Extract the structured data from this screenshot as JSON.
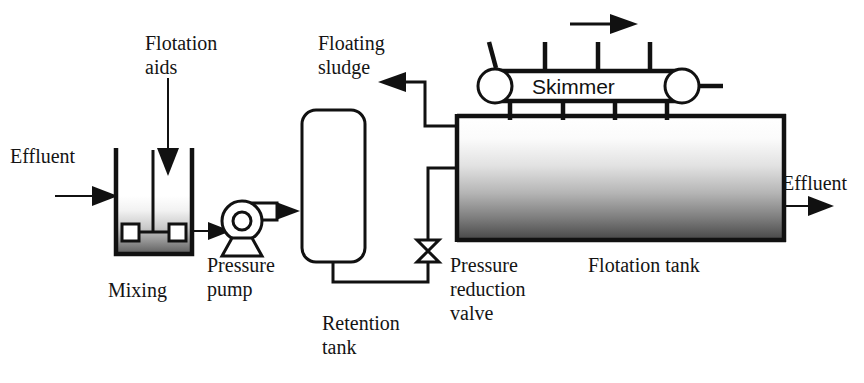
{
  "diagram": {
    "type": "process-flow",
    "labels": {
      "effluent_in": "Effluent",
      "flotation_aids": "Flotation\naids",
      "flotation_aids_line1": "Flotation",
      "flotation_aids_line2": "aids",
      "floating_sludge_line1": "Floating",
      "floating_sludge_line2": "sludge",
      "mixing": "Mixing",
      "pressure_pump_line1": "Pressure",
      "pressure_pump_line2": "pump",
      "retention_tank_line1": "Retention",
      "retention_tank_line2": "tank",
      "pressure_reduction_valve_line1": "Pressure",
      "pressure_reduction_valve_line2": "reduction",
      "pressure_reduction_valve_line3": "valve",
      "skimmer": "Skimmer",
      "flotation_tank": "Flotation tank",
      "effluent_out": "Effluent"
    },
    "components": [
      {
        "name": "mixing-tank",
        "label": "Mixing"
      },
      {
        "name": "pressure-pump",
        "label": "Pressure pump"
      },
      {
        "name": "retention-tank",
        "label": "Retention tank"
      },
      {
        "name": "pressure-reduction-valve",
        "label": "Pressure reduction valve"
      },
      {
        "name": "flotation-tank",
        "label": "Flotation tank"
      },
      {
        "name": "skimmer",
        "label": "Skimmer"
      }
    ],
    "streams": [
      {
        "name": "effluent-inlet",
        "label": "Effluent",
        "direction": "right"
      },
      {
        "name": "flotation-aids-inlet",
        "label": "Flotation aids",
        "direction": "down"
      },
      {
        "name": "floating-sludge-outlet",
        "label": "Floating sludge",
        "direction": "left"
      },
      {
        "name": "effluent-outlet",
        "label": "Effluent",
        "direction": "right"
      },
      {
        "name": "skimmer-travel",
        "label": "",
        "direction": "right"
      }
    ],
    "colors": {
      "line": "#111111",
      "background": "#ffffff",
      "tank_fill_top": "#ffffff",
      "tank_fill_bottom": "#4a4a4a",
      "mixer_fill_top": "#ffffff",
      "mixer_fill_bottom": "#5a5a5a"
    }
  }
}
